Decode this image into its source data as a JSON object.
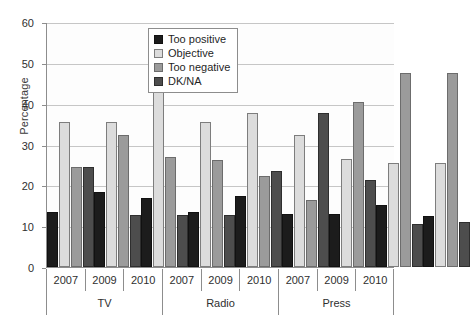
{
  "chart_data": {
    "type": "bar",
    "title": "",
    "xlabel": "",
    "ylabel": "Percentage",
    "ylim": [
      0,
      60
    ],
    "yticks": [
      0,
      10,
      20,
      30,
      40,
      50,
      60
    ],
    "grid": true,
    "legend_position": "top-center",
    "categories": [
      "2007",
      "2009",
      "2010",
      "2007",
      "2009",
      "2010",
      "2007",
      "2009",
      "2010"
    ],
    "group_labels": [
      "TV",
      "Radio",
      "Press"
    ],
    "group_span": 3,
    "series": [
      {
        "name": "Too positive",
        "color": "#1c1c1c",
        "values": [
          13.5,
          18.3,
          17.0,
          13.5,
          17.3,
          13.0,
          13.0,
          15.2,
          12.5
        ]
      },
      {
        "name": "Objective",
        "color": "#dcdcdc",
        "values": [
          35.5,
          35.5,
          43.5,
          35.5,
          37.7,
          32.4,
          26.5,
          25.5,
          25.5
        ]
      },
      {
        "name": "Too negative",
        "color": "#9b9b9b",
        "values": [
          24.5,
          32.4,
          27.0,
          26.2,
          22.2,
          16.3,
          40.5,
          47.5,
          47.5
        ]
      },
      {
        "name": "DK/NA",
        "color": "#4d4d4d",
        "values": [
          24.5,
          12.8,
          12.7,
          12.8,
          23.5,
          37.7,
          21.2,
          10.5,
          11.0
        ]
      }
    ]
  }
}
